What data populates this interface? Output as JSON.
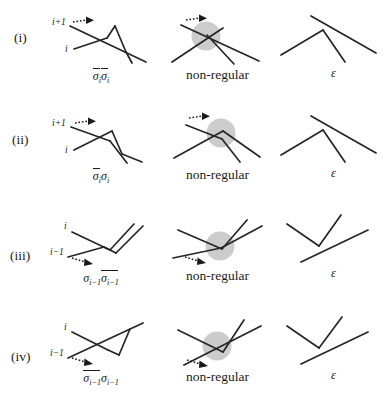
{
  "figure": {
    "width": 388,
    "height": 419,
    "line_color": "#262626",
    "blob_color": "#b9b9b9",
    "background": "#ffffff"
  },
  "rows": [
    {
      "label": "(i)",
      "index_top": "i+1",
      "index_bottom": "i",
      "word_parts": [
        {
          "text": "σ",
          "sub": "i",
          "overline": false
        },
        {
          "text": "σ",
          "sub": "i",
          "overline": true
        }
      ],
      "word_plain": "σiσ̄i",
      "middle_caption": "non-regular",
      "right_caption": "ε"
    },
    {
      "label": "(ii)",
      "index_top": "i+1",
      "index_bottom": "i",
      "word_parts": [
        {
          "text": "σ",
          "sub": "i",
          "overline": true
        },
        {
          "text": "σ",
          "sub": "i",
          "overline": false
        }
      ],
      "word_plain": "σ̄iσi",
      "middle_caption": "non-regular",
      "right_caption": "ε"
    },
    {
      "label": "(iii)",
      "index_top": "i",
      "index_bottom": "i−1",
      "word_parts": [
        {
          "text": "σ",
          "sub": "i−1",
          "overline": false
        },
        {
          "text": "σ",
          "sub": "i−1",
          "overline": true
        }
      ],
      "word_plain": "σi−1σ̄i−1",
      "middle_caption": "non-regular",
      "right_caption": "ε"
    },
    {
      "label": "(iv)",
      "index_top": "i",
      "index_bottom": "i−1",
      "word_parts": [
        {
          "text": "σ",
          "sub": "i−1",
          "overline": true
        },
        {
          "text": "σ",
          "sub": "i−1",
          "overline": false
        }
      ],
      "word_plain": "σ̄i−1σi−1",
      "middle_caption": "non-regular",
      "right_caption": "ε"
    }
  ]
}
